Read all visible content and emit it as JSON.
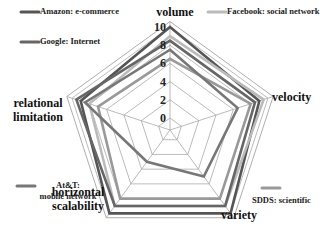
{
  "chart_data": {
    "type": "radar",
    "title": "",
    "axes": [
      "volume",
      "velocity",
      "variety",
      "horizontal scalability",
      "relational limitation"
    ],
    "axis_label_lines": [
      [
        "volume"
      ],
      [
        "velocity"
      ],
      [
        "variety"
      ],
      [
        "horizontal",
        "scalability"
      ],
      [
        "relational",
        "limitation"
      ]
    ],
    "ticks": [
      "0",
      "2",
      "4",
      "6",
      "8",
      "10"
    ],
    "range": [
      0,
      10
    ],
    "grid": true,
    "legend_position": "corners",
    "series": [
      {
        "name": "Amazon: e-commerce",
        "color": "#555555",
        "width": 2.6,
        "values": [
          10,
          9,
          10,
          10,
          9
        ]
      },
      {
        "name": "Facebook: social network",
        "color": "#bbbbbb",
        "width": 2.6,
        "values": [
          9,
          9.5,
          9,
          9,
          8
        ]
      },
      {
        "name": "Google: Internet",
        "color": "#666666",
        "width": 2.6,
        "values": [
          8.5,
          8.5,
          9,
          9,
          9.5
        ]
      },
      {
        "name": "SDDS: scientific",
        "color": "#999999",
        "width": 2.6,
        "values": [
          6.5,
          8,
          8,
          8,
          7
        ]
      },
      {
        "name": "At&T: mobile network",
        "color": "#777777",
        "width": 2.6,
        "values": [
          7.5,
          6.5,
          5,
          3,
          8.5
        ]
      }
    ],
    "legend": [
      {
        "label_lines": [
          "Amazon: e-commerce"
        ],
        "x": 40,
        "y": 14
      },
      {
        "label_lines": [
          "Google: Internet"
        ],
        "x": 40,
        "y": 44
      },
      {
        "label_lines": [
          "Facebook: social network"
        ],
        "x": 227,
        "y": 14
      },
      {
        "label_lines": [
          "SDDS: scientific"
        ],
        "x": 252,
        "y": 200
      },
      {
        "label_lines": [
          "At&T:",
          "mobile network"
        ],
        "x": 40,
        "y": 188
      }
    ]
  }
}
